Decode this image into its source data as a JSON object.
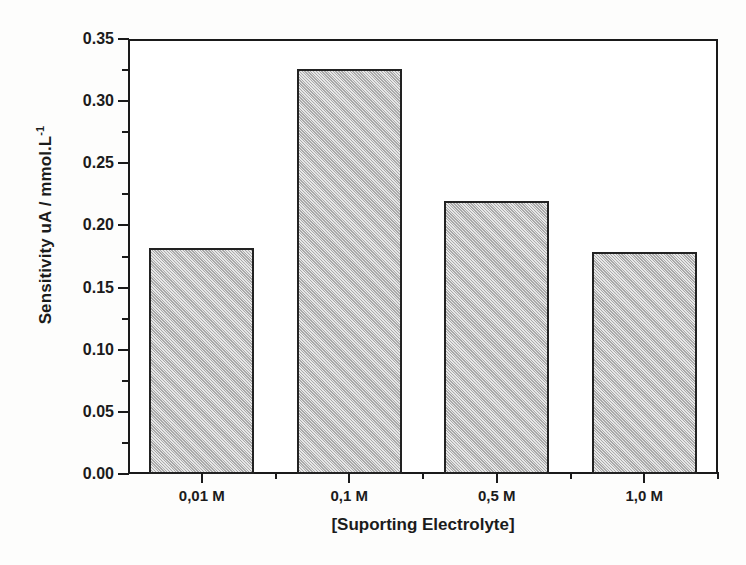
{
  "chart_data": {
    "type": "bar",
    "title": "",
    "xlabel": "[Suporting Electrolyte]",
    "ylabel": "Sensitivity uA / mmol.L",
    "ylabel_sup": "-1",
    "categories": [
      "0,01 M",
      "0,1 M",
      "0,5 M",
      "1,0 M"
    ],
    "values": [
      0.182,
      0.326,
      0.22,
      0.179
    ],
    "ylim": [
      0.0,
      0.35
    ],
    "ytick_labels": [
      "0.00",
      "0.05",
      "0.10",
      "0.15",
      "0.20",
      "0.25",
      "0.30",
      "0.35"
    ],
    "ytick_values": [
      0.0,
      0.05,
      0.1,
      0.15,
      0.2,
      0.25,
      0.3,
      0.35
    ],
    "yminor_values": [
      0.025,
      0.075,
      0.125,
      0.175,
      0.225,
      0.275,
      0.325
    ],
    "grid": false,
    "legend": null,
    "bar_fill": "#bfbfbf",
    "bar_edge": "#222222",
    "frame_color": "#1a1a1a",
    "background": "#ffffff"
  }
}
